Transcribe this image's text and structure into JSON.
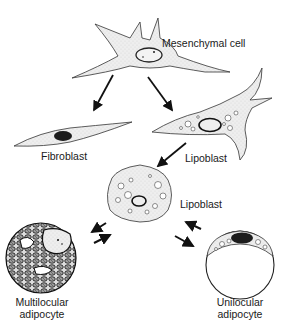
{
  "diagram": {
    "nodes": [
      {
        "id": "mesenchymal",
        "label": "Mesenchymal cell"
      },
      {
        "id": "fibroblast",
        "label": "Fibroblast"
      },
      {
        "id": "lipoblast1",
        "label": "Lipoblast"
      },
      {
        "id": "lipoblast2",
        "label": "Lipoblast"
      },
      {
        "id": "multilocular",
        "label_line1": "Multilocular",
        "label_line2": "adipocyte"
      },
      {
        "id": "unilocular",
        "label_line1": "Unilocular",
        "label_line2": "adipocyte"
      }
    ],
    "edges": [
      {
        "from": "mesenchymal",
        "to": "fibroblast",
        "type": "one-way"
      },
      {
        "from": "mesenchymal",
        "to": "lipoblast1",
        "type": "one-way"
      },
      {
        "from": "lipoblast1",
        "to": "lipoblast2",
        "type": "one-way"
      },
      {
        "from": "lipoblast2",
        "to": "multilocular",
        "type": "two-way"
      },
      {
        "from": "lipoblast2",
        "to": "unilocular",
        "type": "two-way"
      }
    ],
    "colors": {
      "cell_fill": "#ececec",
      "outline": "#333333",
      "nucleus": "#222222",
      "arrow": "#111111"
    }
  }
}
